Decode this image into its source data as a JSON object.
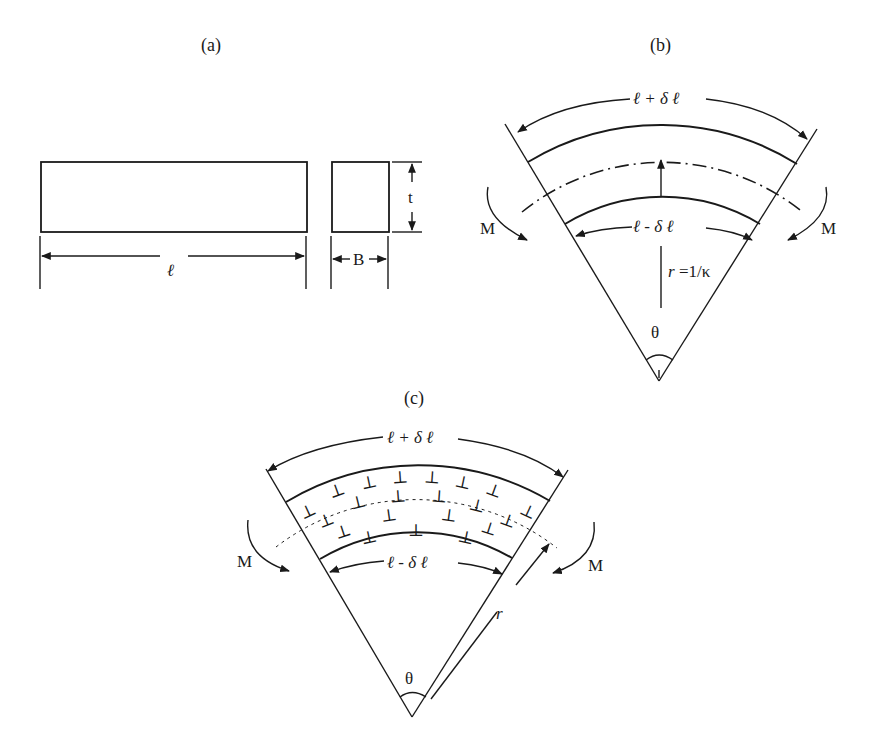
{
  "figure": {
    "panels": [
      {
        "id": "a",
        "label": "(a)"
      },
      {
        "id": "b",
        "label": "(b)"
      },
      {
        "id": "c",
        "label": "(c)"
      }
    ],
    "panel_a": {
      "length_label": "ℓ",
      "width_label": "B",
      "thickness_label": "t"
    },
    "panel_b": {
      "outer_length_label": "ℓ + δ ℓ",
      "inner_length_label": "ℓ - δ ℓ",
      "radius_label_var": "r",
      "radius_label_rest": " =1/κ",
      "angle_label": "θ",
      "moment_left": "M",
      "moment_right": "M"
    },
    "panel_c": {
      "outer_length_label": "ℓ + δ ℓ",
      "inner_length_label": "ℓ - δ ℓ",
      "radius_label": "r",
      "angle_label": "θ",
      "moment_left": "M",
      "moment_right": "M",
      "dislocation_symbol": "⊥"
    },
    "colors": {
      "ink": "#1a1a1a",
      "background": "#ffffff"
    }
  }
}
